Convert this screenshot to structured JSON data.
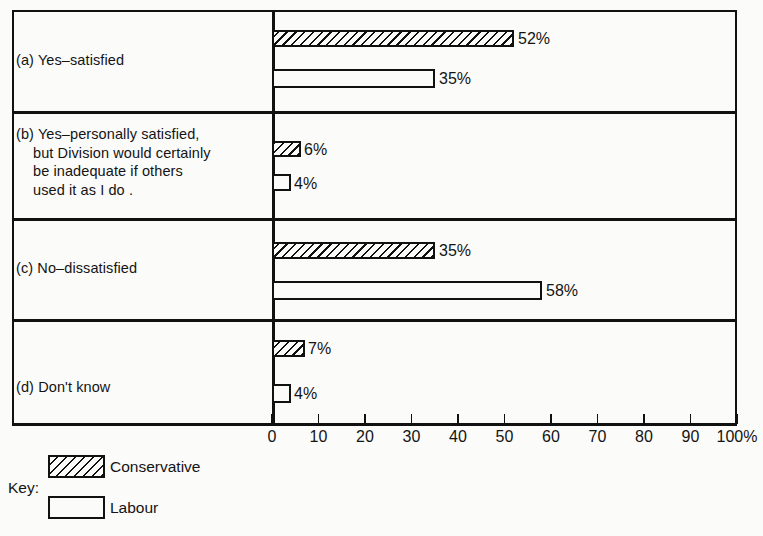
{
  "chart_data": {
    "type": "bar",
    "orientation": "horizontal",
    "title": "",
    "xlabel": "",
    "ylabel": "",
    "xlim": [
      0,
      100
    ],
    "xticks": [
      "0",
      "10",
      "20",
      "30",
      "40",
      "50",
      "60",
      "70",
      "80",
      "90",
      "100%"
    ],
    "grid": false,
    "legend_position": "below-left",
    "legend_title": "Key:",
    "categories": [
      "(a) Yes–satisfied",
      "(b) Yes–personally satisfied, but Division would certainly be inadequate if others used it as I do",
      "(c) No–dissatisfied",
      "(d) Don't know"
    ],
    "series": [
      {
        "name": "Conservative",
        "values": [
          52,
          6,
          35,
          7
        ],
        "pattern": "diagonal-hatch"
      },
      {
        "name": "Labour",
        "values": [
          35,
          4,
          58,
          4
        ],
        "pattern": "solid-white"
      }
    ],
    "value_labels": {
      "Conservative": [
        "52%",
        "6%",
        "35%",
        "7%"
      ],
      "Labour": [
        "35%",
        "4%",
        "58%",
        "4%"
      ]
    }
  },
  "groups": [
    {
      "id": "a",
      "label_lines": [
        "(a) Yes–satisfied"
      ],
      "bars": [
        {
          "party": "Conservative",
          "value": 52,
          "label": "52%"
        },
        {
          "party": "Labour",
          "value": 35,
          "label": "35%"
        }
      ]
    },
    {
      "id": "b",
      "label_lines": [
        "(b) Yes–personally satisfied,",
        "but Division would certainly",
        "be inadequate if others",
        "used it as I do        ."
      ],
      "bars": [
        {
          "party": "Conservative",
          "value": 6,
          "label": "6%"
        },
        {
          "party": "Labour",
          "value": 4,
          "label": "4%"
        }
      ]
    },
    {
      "id": "c",
      "label_lines": [
        "(c) No–dissatisfied"
      ],
      "bars": [
        {
          "party": "Conservative",
          "value": 35,
          "label": "35%"
        },
        {
          "party": "Labour",
          "value": 58,
          "label": "58%"
        }
      ]
    },
    {
      "id": "d",
      "label_lines": [
        "(d) Don't know"
      ],
      "bars": [
        {
          "party": "Conservative",
          "value": 7,
          "label": "7%"
        },
        {
          "party": "Labour",
          "value": 4,
          "label": "4%"
        }
      ]
    }
  ],
  "axis": {
    "ticks": [
      "0",
      "10",
      "20",
      "30",
      "40",
      "50",
      "60",
      "70",
      "80",
      "90",
      "100%"
    ]
  },
  "legend": {
    "title": "Key:",
    "entries": [
      {
        "name": "Conservative",
        "pattern": "diagonal-hatch"
      },
      {
        "name": "Labour",
        "pattern": "solid-white"
      }
    ]
  },
  "colors": {
    "ink": "#111111",
    "paper": "#fbfbfa"
  }
}
